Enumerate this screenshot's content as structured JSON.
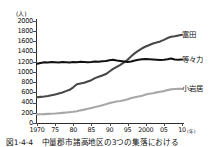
{
  "chart_data": {
    "type": "line",
    "title": "",
    "xlabel": "年",
    "ylabel": "人",
    "y_unit_label": "(人)",
    "x_unit_label": "(年)",
    "xlim": [
      1970,
      2010
    ],
    "ylim": [
      0,
      2000
    ],
    "grid": false,
    "legend_position": "right",
    "yticks": [
      0,
      200,
      400,
      600,
      800,
      1000,
      1200,
      1400,
      1600,
      1800,
      2000
    ],
    "ytick_labels": [
      "0",
      "200",
      "400",
      "600",
      "800",
      "1000",
      "1200",
      "1400",
      "1600",
      "1800",
      "2000"
    ],
    "xticks": [
      1970,
      1975,
      1980,
      1985,
      1990,
      1995,
      2000,
      2005,
      2010
    ],
    "xtick_labels": [
      "1970",
      "75",
      "80",
      "85",
      "90",
      "95",
      "2000",
      "05",
      "10"
    ],
    "x": [
      1970,
      1971,
      1972,
      1973,
      1974,
      1975,
      1976,
      1977,
      1978,
      1979,
      1980,
      1981,
      1982,
      1983,
      1984,
      1985,
      1986,
      1987,
      1988,
      1989,
      1990,
      1991,
      1992,
      1993,
      1994,
      1995,
      1996,
      1997,
      1998,
      1999,
      2000,
      2001,
      2002,
      2003,
      2004,
      2005,
      2006,
      2007,
      2008,
      2009,
      2010
    ],
    "series": [
      {
        "name": "富田",
        "color": "#474747",
        "values": [
          505,
          512,
          520,
          530,
          545,
          560,
          580,
          600,
          625,
          650,
          700,
          760,
          775,
          790,
          815,
          840,
          880,
          905,
          930,
          960,
          1010,
          1060,
          1100,
          1140,
          1190,
          1240,
          1310,
          1370,
          1420,
          1465,
          1500,
          1530,
          1560,
          1580,
          1600,
          1630,
          1665,
          1690,
          1700,
          1715,
          1730
        ]
      },
      {
        "name": "等々力",
        "color": "#111111",
        "values": [
          1160,
          1175,
          1190,
          1185,
          1195,
          1190,
          1185,
          1195,
          1190,
          1185,
          1195,
          1190,
          1200,
          1195,
          1190,
          1195,
          1205,
          1200,
          1210,
          1215,
          1230,
          1240,
          1225,
          1215,
          1205,
          1195,
          1205,
          1225,
          1240,
          1250,
          1255,
          1250,
          1245,
          1240,
          1235,
          1240,
          1250,
          1265,
          1245,
          1240,
          1245
        ]
      },
      {
        "name": "小岩居",
        "color": "#a8a8a8",
        "values": [
          170,
          172,
          175,
          178,
          182,
          186,
          192,
          198,
          205,
          212,
          220,
          232,
          248,
          262,
          278,
          296,
          312,
          330,
          348,
          368,
          390,
          405,
          420,
          432,
          448,
          465,
          490,
          505,
          520,
          535,
          558,
          572,
          585,
          600,
          612,
          625,
          645,
          660,
          668,
          670,
          672
        ]
      }
    ]
  },
  "caption": {
    "figure_number": "図1-4-4",
    "text": "中量郡市諸高地区の3つの集落における"
  }
}
